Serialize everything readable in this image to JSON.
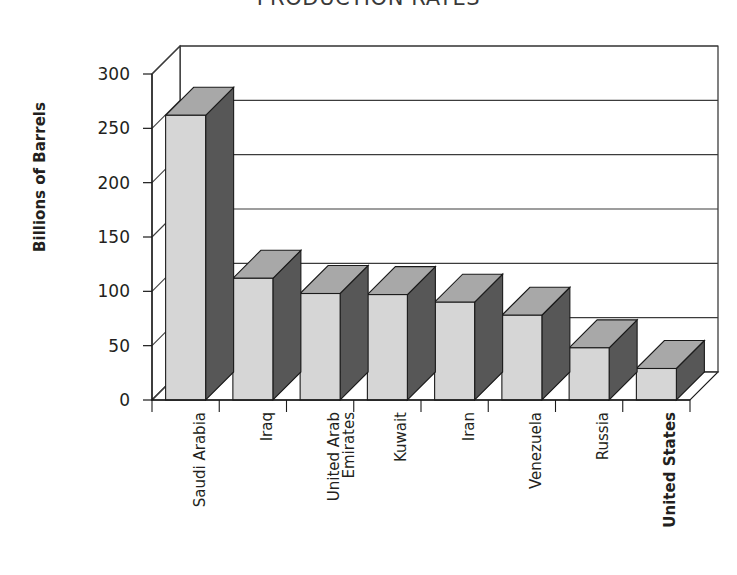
{
  "chart_data": {
    "type": "bar",
    "title": "PRODUCTION RATES",
    "subtitle": "",
    "xlabel": "",
    "ylabel": "Billions of Barrels",
    "ylim": [
      0,
      300
    ],
    "ytick_values": [
      0,
      50,
      100,
      150,
      200,
      250,
      300
    ],
    "ytick_labels": [
      "0",
      "50",
      "100",
      "150",
      "200",
      "250",
      "300"
    ],
    "grid": true,
    "grid_axis": "y",
    "legend": false,
    "legend_position": "none",
    "style": "3d-column",
    "categories": [
      "Saudi Arabia",
      "Iraq",
      "United Arab Emirates",
      "Kuwait",
      "Iran",
      "Venezuela",
      "Russia",
      "United States"
    ],
    "category_lines": [
      [
        "Saudi Arabia"
      ],
      [
        "Iraq"
      ],
      [
        "United Arab",
        "Emirates"
      ],
      [
        "Kuwait"
      ],
      [
        "Iran"
      ],
      [
        "Venezuela"
      ],
      [
        "Russia"
      ],
      [
        "United States"
      ]
    ],
    "category_emphasis": [
      false,
      false,
      false,
      false,
      false,
      false,
      false,
      true
    ],
    "values": [
      262,
      112,
      98,
      97,
      90,
      78,
      48,
      29
    ],
    "series": [
      {
        "name": "Proven Reserves",
        "values": [
          262,
          112,
          98,
          97,
          90,
          78,
          48,
          29
        ]
      }
    ],
    "colors": {
      "bar_front": "#d6d6d6",
      "bar_side": "#575757",
      "bar_top": "#a8a8a8",
      "outline": "#1a1a1a",
      "gridline": "#3c3c3c",
      "floor": "#ffffff",
      "text": "#231f20",
      "background": "#ffffff"
    }
  },
  "axes": {
    "y_title": "Billions of Barrels",
    "y_ticks": [
      "300",
      "250",
      "200",
      "150",
      "100",
      "50",
      "0"
    ]
  },
  "labels": {
    "x_categories": [
      "Saudi Arabia",
      "Iraq",
      "United Arab\nEmirates",
      "Kuwait",
      "Iran",
      "Venezuela",
      "Russia",
      "United States"
    ]
  },
  "header": {
    "title": "PRODUCTION RATES"
  }
}
